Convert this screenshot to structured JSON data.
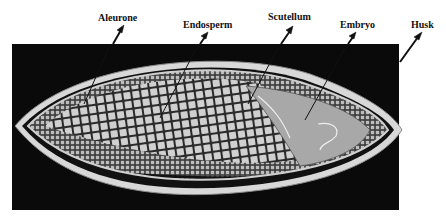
{
  "diagram": {
    "labels": [
      {
        "id": "aleurone",
        "text": "Aleurone"
      },
      {
        "id": "endosperm",
        "text": "Endosperm"
      },
      {
        "id": "scutellum",
        "text": "Scutellum"
      },
      {
        "id": "embryo",
        "text": "Embryo"
      },
      {
        "id": "husk",
        "text": "Husk"
      }
    ],
    "colors": {
      "background_panel": "#0a0a0a",
      "husk": "#d9d9d9",
      "endosperm_cells": "#d4d4d4",
      "embryo_fill": "#a8a8a8",
      "label_text": "#111111"
    }
  }
}
